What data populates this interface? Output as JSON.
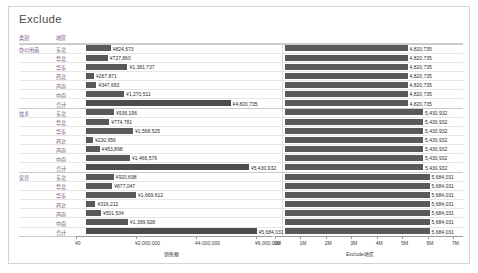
{
  "worksheet": {
    "title": "Exclude"
  },
  "columns": {
    "category_header": "类别",
    "region_header": "地区"
  },
  "axes": {
    "left": {
      "name": "销售额",
      "ticks": [
        "¥0",
        "¥2,000,000",
        "¥4,000,000",
        "¥6,000,000"
      ],
      "values": [
        0,
        2000000,
        4000000,
        6000000
      ],
      "max": 6500000
    },
    "right": {
      "name": "Exclude地区",
      "ticks": [
        "0M",
        "1M",
        "2M",
        "3M",
        "4M",
        "5M",
        "6M",
        "7M"
      ],
      "values": [
        0,
        1,
        2,
        3,
        4,
        5,
        6,
        7
      ],
      "max": 7
    }
  },
  "chart_data": {
    "type": "bar",
    "title": "Exclude",
    "xlabel": "销售额",
    "ylabel": "",
    "grid": true,
    "legend": "none",
    "groups": [
      {
        "category": "办公用品",
        "total_label": "¥4,820,735",
        "total_value": 4820735,
        "exclude_label": "4,820,735",
        "exclude_value": 4820735,
        "rows": [
          {
            "region": "东北",
            "sales_label": "¥824,673",
            "sales": 824673
          },
          {
            "region": "华北",
            "sales_label": "¥727,860",
            "sales": 727860
          },
          {
            "region": "华东",
            "sales_label": "¥1,381,737",
            "sales": 1381737
          },
          {
            "region": "西北",
            "sales_label": "¥267,871",
            "sales": 267871
          },
          {
            "region": "西南",
            "sales_label": "¥347,693",
            "sales": 347693
          },
          {
            "region": "中南",
            "sales_label": "¥1,270,511",
            "sales": 1270511
          },
          {
            "region": "合计",
            "sales_label": "¥4,820,735",
            "sales": 4820735
          }
        ]
      },
      {
        "category": "技术",
        "total_label": "¥5,430,932",
        "total_value": 5430932,
        "exclude_label": "5,430,932",
        "exclude_value": 5430932,
        "rows": [
          {
            "region": "东北",
            "sales_label": "¥936,196",
            "sales": 936196
          },
          {
            "region": "华北",
            "sales_label": "¥774,781",
            "sales": 774781
          },
          {
            "region": "华东",
            "sales_label": "¥1,568,525",
            "sales": 1568525
          },
          {
            "region": "西北",
            "sales_label": "¥230,956",
            "sales": 230956
          },
          {
            "region": "西南",
            "sales_label": "¥453,898",
            "sales": 453898
          },
          {
            "region": "中南",
            "sales_label": "¥1,466,576",
            "sales": 1466576
          },
          {
            "region": "合计",
            "sales_label": "¥5,430,932",
            "sales": 5430932
          }
        ]
      },
      {
        "category": "家具",
        "total_label": "¥5,684,031",
        "total_value": 5684031,
        "exclude_label": "5,684,031",
        "exclude_value": 5684031,
        "rows": [
          {
            "region": "东北",
            "sales_label": "¥920,698",
            "sales": 920698
          },
          {
            "region": "华北",
            "sales_label": "¥877,047",
            "sales": 877047
          },
          {
            "region": "华东",
            "sales_label": "¥1,669,612",
            "sales": 1669612
          },
          {
            "region": "西北",
            "sales_label": "¥316,212",
            "sales": 316212
          },
          {
            "region": "西南",
            "sales_label": "¥501,534",
            "sales": 501534
          },
          {
            "region": "中南",
            "sales_label": "¥1,399,928",
            "sales": 1399928
          },
          {
            "region": "合计",
            "sales_label": "¥5,684,031",
            "sales": 5684031
          }
        ]
      }
    ]
  },
  "colors": {
    "bar": "#595959",
    "header_text": "#7a5c8a",
    "axis": "#9b9b9b"
  }
}
